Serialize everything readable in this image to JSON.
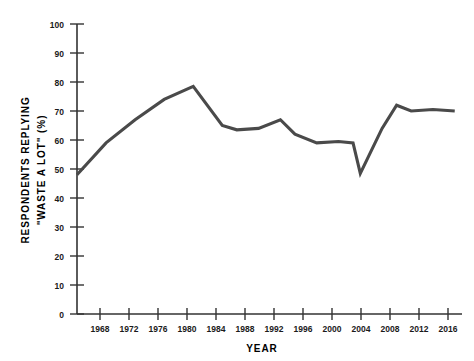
{
  "chart_data": {
    "type": "line",
    "title": "",
    "xlabel": "YEAR",
    "ylabel": "RESPONDENTS REPLYING \"WASTE A LOT\" (%)",
    "ylabel_line1": "RESPONDENTS REPLYING",
    "ylabel_line2": "\"WASTE A LOT\" (%)",
    "xlim": [
      1964,
      2017
    ],
    "ylim": [
      0,
      100
    ],
    "grid": false,
    "legend": null,
    "line_color": "#4a4a4a",
    "axis_color": "#333333",
    "x_ticks": [
      1968,
      1972,
      1976,
      1980,
      1984,
      1988,
      1992,
      1996,
      2000,
      2004,
      2008,
      2012,
      2016
    ],
    "x_tick_labels": [
      "1968",
      "1972",
      "1976",
      "1980",
      "1984",
      "1988",
      "1992",
      "1996",
      "2000",
      "2004",
      "2008",
      "2012",
      "2016"
    ],
    "y_ticks": [
      0,
      10,
      20,
      30,
      40,
      50,
      60,
      70,
      80,
      90,
      100
    ],
    "y_tick_labels": [
      "0",
      "10",
      "20",
      "30",
      "40",
      "50",
      "60",
      "70",
      "80",
      "90",
      "100"
    ],
    "series": [
      {
        "name": "Respondents replying \"waste a lot\"",
        "x": [
          1964,
          1968,
          1972,
          1976,
          1980,
          1984,
          1986,
          1989,
          1992,
          1994,
          1997,
          2000,
          2002,
          2003,
          2006,
          2008,
          2010,
          2013,
          2016
        ],
        "values": [
          48,
          59,
          67,
          74,
          78.5,
          65,
          63.5,
          64,
          67,
          62,
          59,
          59.5,
          59,
          48.5,
          64,
          72,
          70,
          70.5,
          70
        ]
      }
    ]
  }
}
